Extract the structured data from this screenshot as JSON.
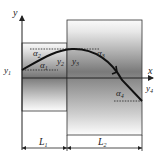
{
  "diagram": {
    "axes": {
      "x_label": "x",
      "y_label": "y"
    },
    "point_labels": {
      "y1": "y",
      "y1_sub": "1",
      "y2": "y",
      "y2_sub": "2",
      "y3": "y",
      "y3_sub": "3",
      "y4": "y",
      "y4_sub": "4"
    },
    "angle_labels": {
      "a1": "α",
      "a1_sub": "1",
      "a2": "α",
      "a2_sub": "2",
      "a3": "α",
      "a3_sub": "3",
      "a4": "α",
      "a4_sub": "4"
    },
    "dimensions": {
      "L1": "L",
      "L1_sub": "1",
      "L2": "L",
      "L2_sub": "2"
    },
    "colors": {
      "line": "#222222",
      "box_dark": "#7a7a7a",
      "box_light": "#f4f4f4"
    }
  }
}
